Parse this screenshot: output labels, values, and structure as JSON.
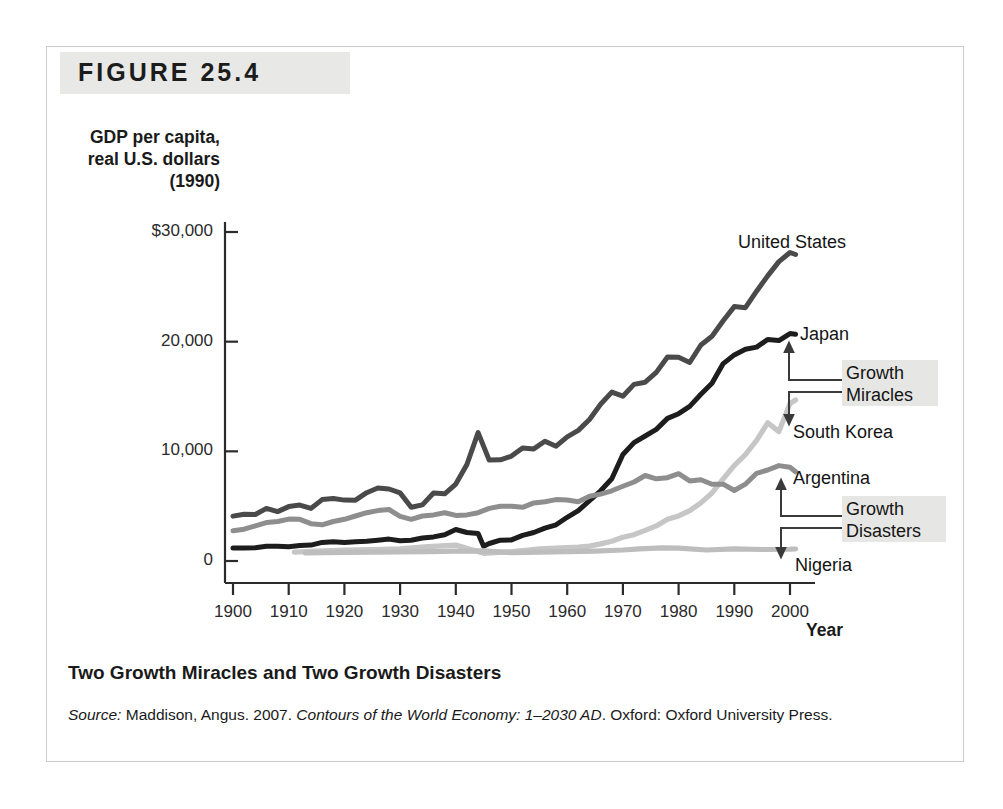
{
  "figure": {
    "banner_label": "FIGURE 25.4",
    "caption": "Two Growth Miracles and Two Growth Disasters",
    "source_prefix": "Source:",
    "source_author": " Maddison, Angus. 2007. ",
    "source_title": "Contours of the World Economy: 1–2030 AD",
    "source_rest": ". Oxford: Oxford University Press."
  },
  "annotations": {
    "growth_miracles_line1": "Growth",
    "growth_miracles_line2": "Miracles",
    "growth_disasters_line1": "Growth",
    "growth_disasters_line2": "Disasters"
  },
  "colors": {
    "united_states": "#4a4a4a",
    "japan": "#1d1d1d",
    "south_korea": "#c6c6c6",
    "argentina": "#8e8e8e",
    "nigeria": "#bdbdbd",
    "axis": "#2b2b2b",
    "banner_bg": "#e8e8e6",
    "highlight_bg": "#e6e6e4",
    "frame_border": "#c9ccd1"
  },
  "chart_data": {
    "type": "line",
    "title": "Two Growth Miracles and Two Growth Disasters",
    "xlabel": "Year",
    "ylabel": "GDP per capita,\nreal U.S. dollars\n(1990)",
    "xlim": [
      1900,
      2003
    ],
    "ylim": [
      0,
      31500
    ],
    "grid": false,
    "legend": "inline-right-labels",
    "xticks": [
      1900,
      1910,
      1920,
      1930,
      1940,
      1950,
      1960,
      1970,
      1980,
      1990,
      2000
    ],
    "xtick_labels": [
      "1900",
      "1910",
      "1920",
      "1930",
      "1940",
      "1950",
      "1960",
      "1970",
      "1980",
      "1990",
      "2000"
    ],
    "yticks": [
      0,
      10000,
      20000,
      30000
    ],
    "ytick_labels": [
      "0",
      "10,000",
      "20,000",
      "$30,000"
    ],
    "series": [
      {
        "name": "United States",
        "color": "#4a4a4a",
        "label_x": 1995,
        "label_y": 29600,
        "x": [
          1900,
          1902,
          1904,
          1906,
          1908,
          1910,
          1912,
          1914,
          1916,
          1918,
          1920,
          1922,
          1924,
          1926,
          1928,
          1930,
          1932,
          1934,
          1936,
          1938,
          1940,
          1942,
          1944,
          1946,
          1948,
          1950,
          1952,
          1954,
          1956,
          1958,
          1960,
          1962,
          1964,
          1966,
          1968,
          1970,
          1972,
          1974,
          1976,
          1978,
          1980,
          1982,
          1984,
          1986,
          1988,
          1990,
          1992,
          1994,
          1996,
          1998,
          2000,
          2001
        ],
        "values": [
          4091,
          4268,
          4240,
          4800,
          4500,
          4964,
          5100,
          4800,
          5600,
          5700,
          5552,
          5540,
          6230,
          6660,
          6569,
          6213,
          4908,
          5114,
          6204,
          6126,
          7010,
          8800,
          11709,
          9197,
          9230,
          9561,
          10316,
          10218,
          10914,
          10468,
          11328,
          11905,
          12900,
          14300,
          15400,
          15030,
          16100,
          16300,
          17200,
          18600,
          18577,
          18100,
          19700,
          20500,
          21900,
          23201,
          23100,
          24600,
          26000,
          27300,
          28129,
          27948
        ]
      },
      {
        "name": "Japan",
        "color": "#1d1d1d",
        "label_x": 1993,
        "label_y": 21500,
        "x": [
          1900,
          1902,
          1904,
          1906,
          1908,
          1910,
          1912,
          1914,
          1916,
          1918,
          1920,
          1922,
          1924,
          1926,
          1928,
          1930,
          1932,
          1934,
          1936,
          1938,
          1940,
          1942,
          1944,
          1945,
          1946,
          1948,
          1950,
          1952,
          1954,
          1956,
          1958,
          1960,
          1962,
          1964,
          1966,
          1968,
          1970,
          1972,
          1974,
          1976,
          1978,
          1980,
          1982,
          1984,
          1986,
          1988,
          1990,
          1992,
          1994,
          1996,
          1998,
          2000,
          2001
        ],
        "values": [
          1180,
          1180,
          1200,
          1350,
          1350,
          1304,
          1400,
          1450,
          1700,
          1750,
          1696,
          1750,
          1800,
          1900,
          2000,
          1850,
          1900,
          2100,
          2200,
          2400,
          2874,
          2600,
          2500,
          1346,
          1600,
          1900,
          1921,
          2336,
          2600,
          3000,
          3300,
          3986,
          4600,
          5500,
          6400,
          7500,
          9714,
          10800,
          11400,
          12000,
          13000,
          13428,
          14100,
          15200,
          16200,
          18000,
          18789,
          19300,
          19500,
          20200,
          20100,
          20738,
          20683
        ]
      },
      {
        "name": "South Korea",
        "color": "#c6c6c6",
        "label_x": 1995,
        "label_y": 13200,
        "x": [
          1911,
          1915,
          1920,
          1925,
          1930,
          1935,
          1940,
          1945,
          1950,
          1953,
          1955,
          1960,
          1962,
          1964,
          1966,
          1968,
          1970,
          1972,
          1974,
          1976,
          1978,
          1980,
          1982,
          1984,
          1986,
          1988,
          1990,
          1992,
          1994,
          1996,
          1998,
          2000,
          2001
        ],
        "values": [
          815,
          900,
          1000,
          1050,
          1100,
          1300,
          1450,
          700,
          854,
          1000,
          1100,
          1226,
          1260,
          1360,
          1560,
          1800,
          2167,
          2400,
          2800,
          3200,
          3800,
          4114,
          4600,
          5300,
          6200,
          7500,
          8704,
          9700,
          11000,
          12600,
          11800,
          14375,
          14673
        ]
      },
      {
        "name": "Argentina",
        "color": "#8e8e8e",
        "label_x": 1995,
        "label_y": 8900,
        "x": [
          1900,
          1902,
          1904,
          1906,
          1908,
          1910,
          1912,
          1914,
          1916,
          1918,
          1920,
          1922,
          1924,
          1926,
          1928,
          1930,
          1932,
          1934,
          1936,
          1938,
          1940,
          1942,
          1944,
          1946,
          1948,
          1950,
          1952,
          1954,
          1956,
          1958,
          1960,
          1962,
          1964,
          1966,
          1968,
          1970,
          1972,
          1974,
          1976,
          1978,
          1980,
          1982,
          1984,
          1986,
          1988,
          1990,
          1992,
          1994,
          1996,
          1998,
          2000,
          2001
        ],
        "values": [
          2756,
          2900,
          3200,
          3500,
          3600,
          3822,
          3800,
          3400,
          3300,
          3600,
          3800,
          4100,
          4400,
          4600,
          4700,
          4080,
          3800,
          4100,
          4200,
          4400,
          4161,
          4200,
          4400,
          4800,
          4987,
          4987,
          4900,
          5300,
          5400,
          5600,
          5559,
          5400,
          5900,
          6100,
          6400,
          6811,
          7200,
          7800,
          7500,
          7600,
          7962,
          7300,
          7400,
          7000,
          7000,
          6433,
          7000,
          8000,
          8300,
          8700,
          8544,
          8137
        ]
      },
      {
        "name": "Nigeria",
        "color": "#bdbdbd",
        "label_x": 1995,
        "label_y": 600,
        "x": [
          1913,
          1920,
          1925,
          1930,
          1935,
          1940,
          1945,
          1950,
          1955,
          1960,
          1965,
          1970,
          1973,
          1975,
          1977,
          1980,
          1985,
          1990,
          1995,
          2000,
          2001
        ],
        "values": [
          750,
          780,
          800,
          820,
          850,
          900,
          920,
          753,
          800,
          854,
          900,
          1000,
          1100,
          1150,
          1200,
          1180,
          1000,
          1100,
          1050,
          1080,
          1090
        ]
      }
    ],
    "annotations": [
      {
        "text": "Growth Miracles",
        "points_to": [
          "Japan",
          "South Korea"
        ]
      },
      {
        "text": "Growth Disasters",
        "points_to": [
          "Argentina",
          "Nigeria"
        ]
      }
    ],
    "source": "Maddison, Angus. 2007. Contours of the World Economy: 1–2030 AD. Oxford: Oxford University Press."
  }
}
